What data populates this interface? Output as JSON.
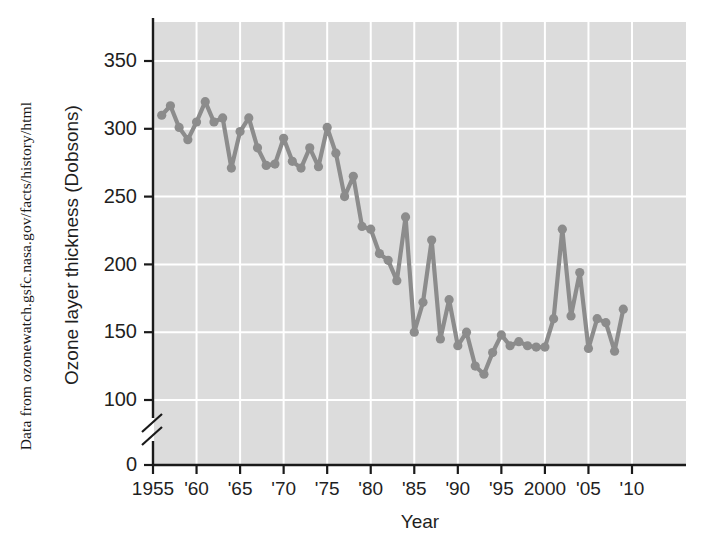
{
  "figure": {
    "source_caption": "Data from ozonewatch.gsfc.nasa.gov/facts/history/html",
    "plot_bg_color": "#dcdcdc",
    "grid_color": "#ffffff",
    "series_color": "#8c8c8c",
    "axis_color": "#1a1a1a",
    "text_color": "#1f1f1f"
  },
  "chart_data": {
    "type": "line",
    "title": "",
    "xlabel": "Year",
    "ylabel": "Ozone layer thickness (Dobsons)",
    "xlim": [
      1954,
      1911.5
    ],
    "ylim": [
      0,
      370
    ],
    "yticks": [
      0,
      100,
      150,
      200,
      250,
      300,
      350
    ],
    "ytick_labels": [
      "0",
      "100",
      "150",
      "200",
      "250",
      "300",
      "350"
    ],
    "y_axis_break": true,
    "y_axis_break_between": [
      0,
      100
    ],
    "xticks": [
      1955,
      1960,
      1965,
      1970,
      1975,
      1980,
      1985,
      1990,
      1995,
      2000,
      2005,
      2010
    ],
    "xtick_labels": [
      "1955",
      "'60",
      "'65",
      "'70",
      "'75",
      "'80",
      "'85",
      "'90",
      "'95",
      "2000",
      "'05",
      "'10"
    ],
    "grid": true,
    "legend": "none",
    "markers": true,
    "x": [
      1956,
      1957,
      1958,
      1959,
      1960,
      1961,
      1962,
      1963,
      1964,
      1965,
      1966,
      1967,
      1968,
      1969,
      1970,
      1971,
      1972,
      1973,
      1974,
      1975,
      1976,
      1977,
      1978,
      1979,
      1980,
      1981,
      1982,
      1983,
      1984,
      1985,
      1986,
      1987,
      1988,
      1989,
      1990,
      1991,
      1992,
      1993,
      1994,
      1995,
      1996,
      1997,
      1998,
      1999,
      2000,
      2001,
      2002,
      2003,
      2004,
      2005,
      2006,
      2007,
      2008,
      2009
    ],
    "values": [
      310,
      317,
      301,
      292,
      305,
      320,
      305,
      308,
      271,
      298,
      308,
      286,
      273,
      274,
      293,
      276,
      271,
      286,
      272,
      301,
      282,
      250,
      265,
      228,
      226,
      208,
      203,
      188,
      235,
      150,
      172,
      218,
      145,
      174,
      140,
      150,
      125,
      119,
      135,
      148,
      140,
      143,
      140,
      139,
      139,
      160,
      226,
      162,
      194,
      138,
      160,
      157,
      136,
      167
    ],
    "ylabel_unit": "Dobsons"
  },
  "axes": {
    "x_title": "Year",
    "y_title": "Ozone layer thickness (Dobsons)"
  }
}
